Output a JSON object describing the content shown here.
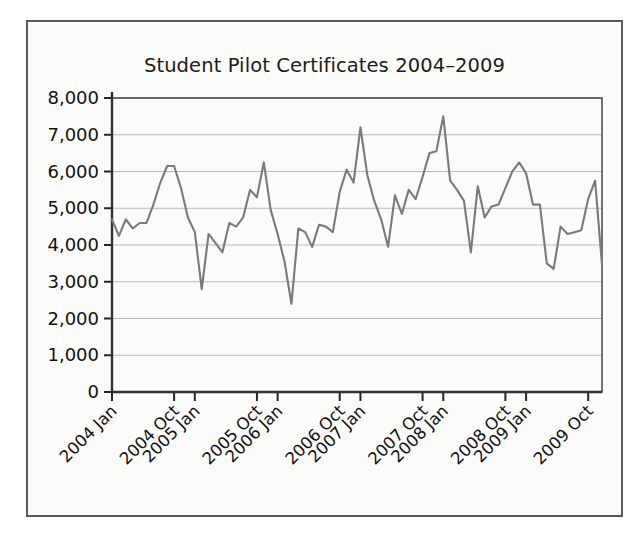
{
  "chart_data": {
    "type": "line",
    "title": "Student Pilot Certificates 2004–2009",
    "xlabel": "",
    "ylabel": "",
    "ylim": [
      0,
      8000
    ],
    "grid": true,
    "legend": false,
    "yticks": [
      0,
      1000,
      2000,
      3000,
      4000,
      5000,
      6000,
      7000,
      8000
    ],
    "ytick_labels": [
      "0",
      "1,000",
      "2,000",
      "3,000",
      "4,000",
      "5,000",
      "6,000",
      "7,000",
      "8,000"
    ],
    "xtick_labels": [
      "2004 Jan",
      "2004 Oct",
      "2005 Jan",
      "2005 Oct",
      "2006 Jan",
      "2006 Oct",
      "2007 Jan",
      "2007 Oct",
      "2008 Jan",
      "2008 Oct",
      "2009 Jan",
      "2009 Oct"
    ],
    "xtick_indices": [
      0,
      9,
      12,
      21,
      24,
      33,
      36,
      45,
      48,
      57,
      60,
      69
    ],
    "x": [
      "2004 Jan",
      "2004 Feb",
      "2004 Mar",
      "2004 Apr",
      "2004 May",
      "2004 Jun",
      "2004 Jul",
      "2004 Aug",
      "2004 Sep",
      "2004 Oct",
      "2004 Nov",
      "2004 Dec",
      "2005 Jan",
      "2005 Feb",
      "2005 Mar",
      "2005 Apr",
      "2005 May",
      "2005 Jun",
      "2005 Jul",
      "2005 Aug",
      "2005 Sep",
      "2005 Oct",
      "2005 Nov",
      "2005 Dec",
      "2006 Jan",
      "2006 Feb",
      "2006 Mar",
      "2006 Apr",
      "2006 May",
      "2006 Jun",
      "2006 Jul",
      "2006 Aug",
      "2006 Sep",
      "2006 Oct",
      "2006 Nov",
      "2006 Dec",
      "2007 Jan",
      "2007 Feb",
      "2007 Mar",
      "2007 Apr",
      "2007 May",
      "2007 Jun",
      "2007 Jul",
      "2007 Aug",
      "2007 Sep",
      "2007 Oct",
      "2007 Nov",
      "2007 Dec",
      "2008 Jan",
      "2008 Feb",
      "2008 Mar",
      "2008 Apr",
      "2008 May",
      "2008 Jun",
      "2008 Jul",
      "2008 Aug",
      "2008 Sep",
      "2008 Oct",
      "2008 Nov",
      "2008 Dec",
      "2009 Jan",
      "2009 Feb",
      "2009 Mar",
      "2009 Apr",
      "2009 May",
      "2009 Jun",
      "2009 Jul",
      "2009 Aug",
      "2009 Sep",
      "2009 Oct",
      "2009 Nov",
      "2009 Dec"
    ],
    "series": [
      {
        "name": "Student Pilot Certificates",
        "color": "#7a7a7a",
        "values": [
          4700,
          4250,
          4700,
          4450,
          4600,
          4600,
          5100,
          5700,
          6150,
          6150,
          5550,
          4750,
          4350,
          2800,
          4300,
          4050,
          3800,
          4600,
          4500,
          4750,
          5500,
          5300,
          6250,
          4950,
          4300,
          3550,
          2400,
          4450,
          4350,
          3950,
          4550,
          4500,
          4350,
          5450,
          6050,
          5700,
          7200,
          5900,
          5200,
          4700,
          3950,
          5350,
          4850,
          5500,
          5250,
          5850,
          6500,
          6550,
          7500,
          5750,
          5500,
          5200,
          3800,
          5600,
          4750,
          5050,
          5100,
          5550,
          6000,
          6250,
          5950,
          5100,
          5100,
          3500,
          3350,
          4500,
          4300,
          4350,
          4400,
          5250,
          5750,
          3450
        ]
      }
    ]
  },
  "figure": {
    "background_color": "#fbfbfa",
    "border_color": "#5a5a5a",
    "grid_color": "#b9b9b9",
    "axis_color": "#262626",
    "text_color": "#111111"
  }
}
